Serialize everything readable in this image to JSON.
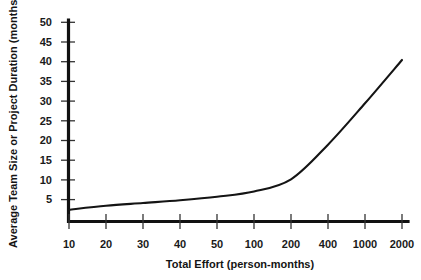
{
  "chart_data": {
    "type": "line",
    "title": "",
    "xlabel": "Total Effort (person-months)",
    "ylabel": "Average Team Size or Project Duration (months)",
    "x_tick_labels": [
      "10",
      "20",
      "30",
      "40",
      "50",
      "100",
      "200",
      "400",
      "1000",
      "2000"
    ],
    "x_scale": "categorical-log",
    "y_tick_labels": [
      "5",
      "10",
      "15",
      "20",
      "25",
      "30",
      "35",
      "40",
      "45",
      "50"
    ],
    "y_tick_values": [
      5,
      10,
      15,
      20,
      25,
      30,
      35,
      40,
      45,
      50
    ],
    "ylim": [
      0,
      50
    ],
    "grid": false,
    "legend": null,
    "series": [
      {
        "name": "Average Team Size or Project Duration",
        "color": "#141414",
        "x": [
          "10",
          "20",
          "30",
          "40",
          "50",
          "100",
          "200",
          "400",
          "1000",
          "2000"
        ],
        "values": [
          3.0,
          4.0,
          4.7,
          5.4,
          6.3,
          7.6,
          10.7,
          19.5,
          30.0,
          41.0
        ]
      }
    ]
  },
  "axes": {
    "x_title": "Total Effort (person-months)",
    "y_title": "Average Team Size or Project Duration (months)"
  },
  "ticks": {
    "x": [
      "10",
      "20",
      "30",
      "40",
      "50",
      "100",
      "200",
      "400",
      "1000",
      "2000"
    ],
    "y": [
      "50",
      "45",
      "40",
      "35",
      "30",
      "25",
      "20",
      "15",
      "10",
      "5"
    ]
  },
  "colors": {
    "curve": "#141414",
    "axis": "#111111",
    "background": "#ffffff"
  },
  "caption": ""
}
